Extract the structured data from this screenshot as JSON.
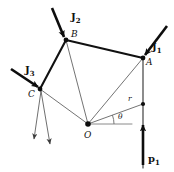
{
  "figure": {
    "type": "structural-truss-free-body-diagram",
    "background_color": "#ffffff",
    "stroke_color": "#111111",
    "thin_stroke_color": "#5a5a5a",
    "width": 174,
    "height": 172
  },
  "nodes": [
    {
      "id": "B",
      "label": "B",
      "x": 66,
      "y": 40,
      "label_x": 71,
      "label_y": 30
    },
    {
      "id": "A",
      "label": "A",
      "x": 143,
      "y": 58,
      "label_x": 146,
      "label_y": 58
    },
    {
      "id": "C",
      "label": "C",
      "x": 40,
      "y": 89,
      "label_x": 28,
      "label_y": 90
    },
    {
      "id": "O",
      "label": "O",
      "x": 88,
      "y": 124,
      "label_x": 84,
      "label_y": 131
    },
    {
      "id": "R",
      "label": "",
      "x": 143,
      "y": 104,
      "label_x": 0,
      "label_y": 0
    }
  ],
  "edges_thick": [
    {
      "from": "B",
      "to": "A"
    },
    {
      "from": "B",
      "to": "C"
    }
  ],
  "edges_thin": [
    {
      "from": "B",
      "to": "O"
    },
    {
      "from": "C",
      "to": "O"
    },
    {
      "from": "O",
      "to": "A"
    },
    {
      "from": "O",
      "to": "R"
    }
  ],
  "vertical_member": {
    "x": 143,
    "y_top": 58,
    "y_bottom": 168
  },
  "angle": {
    "label": "θ",
    "label_x": 118,
    "label_y": 113,
    "vertex": "O",
    "reference_line": {
      "x1": 88,
      "y1": 124,
      "x2": 132,
      "y2": 124
    }
  },
  "radius": {
    "label": "r",
    "label_x": 128,
    "label_y": 95
  },
  "forces": [
    {
      "name": "J2",
      "label": "J",
      "sub": "2",
      "label_x": 71,
      "label_y": 12,
      "tail_x": 52,
      "tail_y": 8,
      "head_x": 64,
      "head_y": 37,
      "style": "thick-load"
    },
    {
      "name": "J1",
      "label": "J",
      "sub": "1",
      "label_x": 152,
      "label_y": 42,
      "tail_x": 167,
      "tail_y": 26,
      "head_x": 145,
      "head_y": 55,
      "style": "thick-load"
    },
    {
      "name": "J3",
      "label": "J",
      "sub": "3",
      "label_x": 25,
      "label_y": 65,
      "tail_x": 11,
      "tail_y": 69,
      "head_x": 38,
      "head_y": 87,
      "style": "thick-load"
    },
    {
      "name": "p1",
      "label": "p",
      "sub": "1",
      "label_x": 148,
      "label_y": 154,
      "tail_x": 143,
      "tail_y": 165,
      "head_x": 143,
      "head_y": 125,
      "style": "thick-load"
    },
    {
      "name": "reaction-C",
      "label": "",
      "sub": "",
      "label_x": 0,
      "label_y": 0,
      "tail_x": 41,
      "tail_y": 91,
      "head_x": 50,
      "head_y": 144,
      "style": "thin-reaction"
    },
    {
      "name": "reaction-C-2",
      "label": "",
      "sub": "",
      "label_x": 0,
      "label_y": 0,
      "tail_x": 41,
      "tail_y": 91,
      "head_x": 34,
      "head_y": 139,
      "style": "thin-reaction"
    }
  ]
}
